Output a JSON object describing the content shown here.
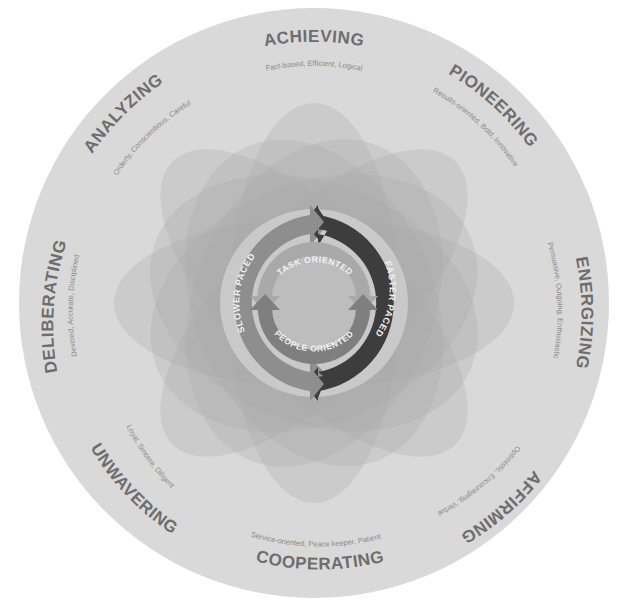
{
  "diagram": {
    "type": "circular-personality-wheel",
    "colors": {
      "background": "#ffffff",
      "outer_circle": "#d9d9d9",
      "petal": "#a8a8a8",
      "center_disc": "#c9c9c9",
      "slower_arrow": "#8e8e8e",
      "faster_arrow": "#3d3d3d",
      "task_arrow": "#a9a9a9",
      "people_arrow": "#7f7f7f",
      "style_text": "#6d6d6d",
      "trait_text": "#8a8a8a"
    },
    "styles": [
      {
        "name": "ACHIEVING",
        "traits": "Fact-based, Efficient, Logical"
      },
      {
        "name": "PIONEERING",
        "traits": "Results-oriented, Bold, Innovative"
      },
      {
        "name": "ENERGIZING",
        "traits": "Persuasive, Outgoing, Enthusiastic"
      },
      {
        "name": "AFFIRMING",
        "traits": "Optimistic, Encouraging, Verbal"
      },
      {
        "name": "COOPERATING",
        "traits": "Service-oriented, Peace keeper, Patient"
      },
      {
        "name": "UNWAVERING",
        "traits": "Loyal, Sincere, Diligent"
      },
      {
        "name": "DELIBERATING",
        "traits": "Devoted, Accurate, Disciplined"
      },
      {
        "name": "ANALYZING",
        "traits": "Orderly, Conscientious, Careful"
      }
    ],
    "center": {
      "outer_ring": {
        "left_label": "SLOWER PACED",
        "right_label": "FASTER PACED"
      },
      "inner_ring": {
        "top_label": "TASK ORIENTED",
        "bottom_label": "PEOPLE ORIENTED"
      }
    }
  }
}
